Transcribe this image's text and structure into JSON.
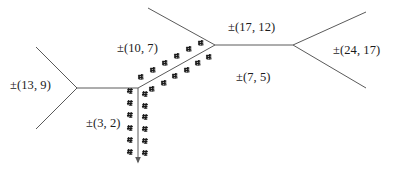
{
  "figure": {
    "width": 401,
    "height": 176,
    "background": "#ffffff",
    "stroke_color": "#5a5a5a",
    "mark_color": "#1a1a1a",
    "text_color": "#1b1b1b"
  },
  "labels": [
    {
      "id": "label-13-9",
      "text": "±(13, 9)",
      "x": 10,
      "y": 78
    },
    {
      "id": "label-10-7",
      "text": "±(10, 7)",
      "x": 117,
      "y": 41
    },
    {
      "id": "label-3-2",
      "text": "±(3, 2)",
      "x": 86,
      "y": 116
    },
    {
      "id": "label-17-12",
      "text": "±(17, 12)",
      "x": 228,
      "y": 20
    },
    {
      "id": "label-7-5",
      "text": "±(7, 5)",
      "x": 236,
      "y": 70
    },
    {
      "id": "label-24-17",
      "text": "±(24, 17)",
      "x": 333,
      "y": 43
    }
  ],
  "nodes": [
    {
      "id": "node-left-fork",
      "x": 77,
      "y": 88
    },
    {
      "id": "node-center",
      "x": 138,
      "y": 88
    },
    {
      "id": "node-upper-mid",
      "x": 215,
      "y": 45
    },
    {
      "id": "node-right-fork",
      "x": 293,
      "y": 45
    }
  ],
  "edges": [
    {
      "id": "edge-leaf-upper-left",
      "x1": 36,
      "y1": 47,
      "x2": 77,
      "y2": 88,
      "label": null
    },
    {
      "id": "edge-leaf-lower-left",
      "x1": 36,
      "y1": 129,
      "x2": 77,
      "y2": 88,
      "label": null
    },
    {
      "id": "edge-13-9",
      "x1": 77,
      "y1": 88,
      "x2": 138,
      "y2": 88,
      "label": "±(13, 9)"
    },
    {
      "id": "edge-10-7",
      "x1": 138,
      "y1": 88,
      "x2": 215,
      "y2": 45,
      "label": "±(10, 7)"
    },
    {
      "id": "edge-3-2",
      "x1": 138,
      "y1": 88,
      "x2": 138,
      "y2": 162,
      "label": "±(3, 2)"
    },
    {
      "id": "edge-leaf-upper-mid",
      "x1": 215,
      "y1": 45,
      "x2": 148,
      "y2": 8,
      "label": null
    },
    {
      "id": "edge-17-12",
      "x1": 215,
      "y1": 45,
      "x2": 293,
      "y2": 45,
      "label": "±(17, 12)"
    },
    {
      "id": "edge-leaf-upper-right",
      "x1": 293,
      "y1": 45,
      "x2": 366,
      "y2": 12,
      "label": null
    },
    {
      "id": "edge-leaf-lower-right",
      "x1": 293,
      "y1": 45,
      "x2": 366,
      "y2": 88,
      "label": null
    }
  ],
  "hatch_marks": {
    "description": "small paired tick glyphs drawn on both sides of two edges",
    "diagonal_edge": {
      "edge_id": "edge-10-7",
      "count_upper_side": 6,
      "count_lower_side": 6
    },
    "vertical_edge": {
      "edge_id": "edge-3-2",
      "count_left_side": 6,
      "count_right_side": 6
    }
  },
  "chart_data": {
    "type": "diagram",
    "title": "",
    "node_labels": [],
    "edge_labels": [
      "±(13, 9)",
      "±(10, 7)",
      "±(3, 2)",
      "±(17, 12)",
      "±(7, 5)",
      "±(24, 17)"
    ],
    "edge_vectors": [
      {
        "label": "±(13, 9)",
        "a": 13,
        "b": 9
      },
      {
        "label": "±(10, 7)",
        "a": 10,
        "b": 7
      },
      {
        "label": "±(3, 2)",
        "a": 3,
        "b": 2
      },
      {
        "label": "±(17, 12)",
        "a": 17,
        "b": 12
      },
      {
        "label": "±(7, 5)",
        "a": 7,
        "b": 5
      },
      {
        "label": "±(24, 17)",
        "a": 24,
        "b": 17
      }
    ]
  }
}
